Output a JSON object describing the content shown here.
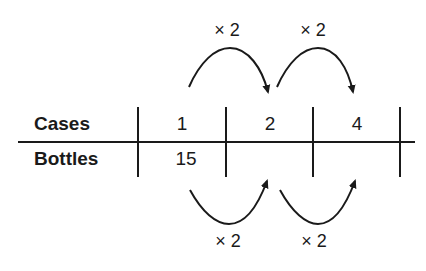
{
  "table": {
    "rows": [
      {
        "label": "Cases",
        "values": [
          "1",
          "2",
          "4"
        ]
      },
      {
        "label": "Bottles",
        "values": [
          "15",
          "",
          ""
        ]
      }
    ]
  },
  "arrows": {
    "top": [
      {
        "label": "× 2",
        "from": "1",
        "to": "2"
      },
      {
        "label": "× 2",
        "from": "2",
        "to": "4"
      }
    ],
    "bottom": [
      {
        "label": "× 2",
        "from": "15",
        "to": ""
      },
      {
        "label": "× 2",
        "from": "",
        "to": ""
      }
    ]
  },
  "colors": {
    "ink": "#1a1a1a",
    "background": "#ffffff"
  }
}
